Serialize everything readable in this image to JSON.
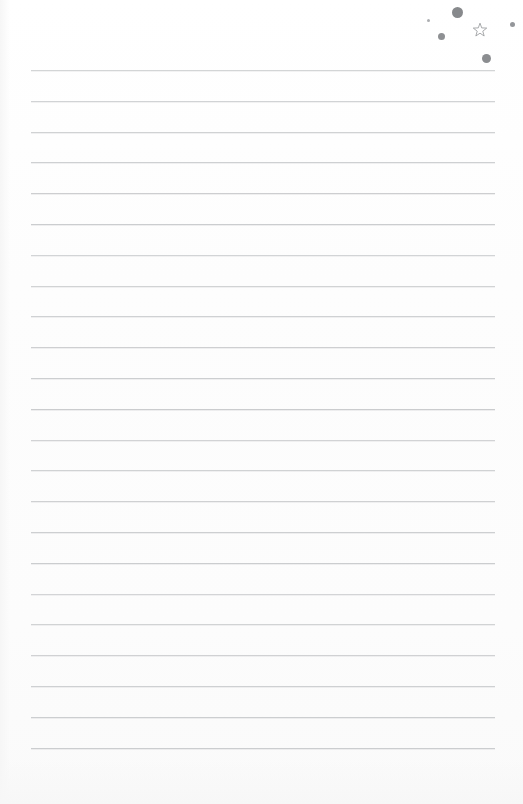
{
  "document": {
    "type": "blank-ruled-notepad-page",
    "title": "Ruled Notepad Page",
    "page_width": 523,
    "page_height": 804,
    "background_color": "#fdfdfd",
    "text_content": "",
    "has_handwriting": false,
    "has_printed_text": false
  },
  "rules": {
    "label": "Ruled writing lines",
    "count": 23,
    "color": "#c9cbcd",
    "thickness_px": 1,
    "left_x": 31,
    "right_x": 495,
    "first_line_y": 70,
    "spacing_px": 30.8,
    "line_y_positions": [
      70,
      100.8,
      131.6,
      162.4,
      193.2,
      224,
      254.8,
      285.6,
      316.4,
      347.2,
      378,
      408.8,
      439.6,
      470.4,
      501.2,
      532,
      562.8,
      593.6,
      624.4,
      655.2,
      686,
      716.8,
      747.6
    ]
  },
  "margins": {
    "left_margin_label": "Left blank margin",
    "left_margin_px": 31,
    "right_margin_px": 28,
    "top_margin_px": 70,
    "bottom_margin_px": 56
  },
  "decorations": {
    "label": "Top-right corner doodle marks",
    "color": "#8e9093",
    "dots": [
      {
        "name": "dot-large",
        "cx": 457,
        "cy": 12,
        "d": 11,
        "color": "#87898c",
        "opacity": 1
      },
      {
        "name": "dot-tiny",
        "cx": 428,
        "cy": 20,
        "d": 3,
        "color": "#a8aaad",
        "opacity": 0.95
      },
      {
        "name": "dot-medium",
        "cx": 441,
        "cy": 36,
        "d": 7,
        "color": "#8e9093",
        "opacity": 1
      },
      {
        "name": "dot-small-right",
        "cx": 512,
        "cy": 24,
        "d": 5,
        "color": "#94969a",
        "opacity": 1
      },
      {
        "name": "dot-bottom",
        "cx": 486,
        "cy": 58,
        "d": 9,
        "color": "#8b8d90",
        "opacity": 1
      }
    ],
    "star": {
      "name": "star-outline",
      "points": 5,
      "filled": false,
      "cx": 480,
      "cy": 30,
      "size": 16,
      "stroke_color": "#9a9c9f",
      "stroke_width": 1.3
    }
  }
}
